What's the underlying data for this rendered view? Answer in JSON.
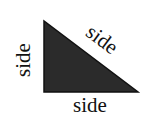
{
  "diagram": {
    "type": "right-triangle",
    "fill_color": "#2b2b2b",
    "stroke_color": "#111111",
    "vertices": {
      "top": [
        44,
        21
      ],
      "bottom_left": [
        44,
        92
      ],
      "right": [
        138,
        92
      ]
    },
    "labels": {
      "left_leg": "side",
      "hypotenuse": "side",
      "base": "side"
    }
  }
}
